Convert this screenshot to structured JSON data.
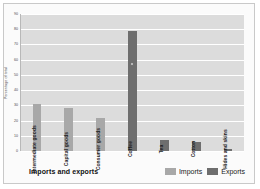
{
  "chart_data": {
    "type": "bar",
    "title": "Imports and exports",
    "xlabel": "",
    "ylabel": "Percentage of total",
    "ylim": [
      0,
      90
    ],
    "ytick_step": 10,
    "yticks": [
      "0",
      "10",
      "20",
      "30",
      "40",
      "50",
      "60",
      "70",
      "80",
      "90"
    ],
    "grid": true,
    "legend_position": "bottom-right",
    "categories": [
      "Intermediate goods",
      "Capital goods",
      "Consumer goods",
      "Coffee",
      "Tea",
      "Cotton",
      "Hides and skins"
    ],
    "series": [
      {
        "name": "Imports",
        "color": "#a8a8a8",
        "values": [
          31,
          28,
          22,
          null,
          null,
          null,
          null
        ]
      },
      {
        "name": "Exports",
        "color": "#6e6e6e",
        "values": [
          null,
          null,
          null,
          79,
          7,
          6,
          1
        ]
      }
    ],
    "bars": [
      {
        "label": "Intermediate goods",
        "value": 31,
        "series": "Imports",
        "color": "#a8a8a8",
        "marker": false
      },
      {
        "label": "Capital goods",
        "value": 28,
        "series": "Imports",
        "color": "#a8a8a8",
        "marker": false
      },
      {
        "label": "Consumer goods",
        "value": 22,
        "series": "Imports",
        "color": "#a8a8a8",
        "marker": false
      },
      {
        "label": "Coffee",
        "value": 79,
        "series": "Exports",
        "color": "#6e6e6e",
        "marker": true
      },
      {
        "label": "Tea",
        "value": 7,
        "series": "Exports",
        "color": "#6e6e6e",
        "marker": false
      },
      {
        "label": "Cotton",
        "value": 6,
        "series": "Exports",
        "color": "#6e6e6e",
        "marker": false
      },
      {
        "label": "Hides and skins",
        "value": 1,
        "series": "Exports",
        "color": "#6e6e6e",
        "marker": false
      }
    ]
  },
  "legend": {
    "items": [
      {
        "label": "Imports",
        "color": "#a8a8a8"
      },
      {
        "label": "Exports",
        "color": "#6e6e6e"
      }
    ]
  },
  "footer": {
    "title": "Imports and exports"
  },
  "colors": {
    "plot_background": "#dcdcdc",
    "gridline": "#ffffff",
    "imports": "#a8a8a8",
    "exports": "#6e6e6e",
    "page_background": "#ffffff"
  }
}
